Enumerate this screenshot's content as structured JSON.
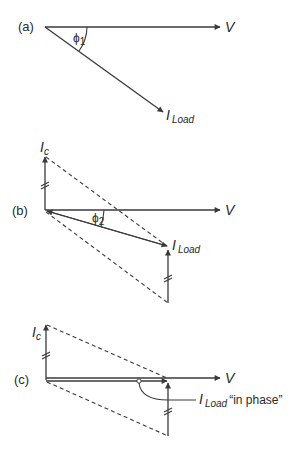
{
  "diagram": {
    "panels": [
      {
        "id": "a",
        "label": "(a)",
        "voltage_label": "V",
        "angle_symbol": "ϕ",
        "angle_subscript": "1",
        "current_label": "I",
        "current_subscript": "Load"
      },
      {
        "id": "b",
        "label": "(b)",
        "voltage_label": "V",
        "angle_symbol": "ϕ",
        "angle_subscript": "2",
        "current_label": "I",
        "current_subscript": "Load",
        "capacitor_label": "I",
        "capacitor_subscript": "c"
      },
      {
        "id": "c",
        "label": "(c)",
        "voltage_label": "V",
        "current_label": "I",
        "current_subscript": "Load",
        "current_annotation": "“in phase”",
        "capacitor_label": "I",
        "capacitor_subscript": "c"
      }
    ],
    "colors": {
      "line": "#3a3a3a",
      "text": "#2a2a2a",
      "background": "#ffffff"
    }
  }
}
